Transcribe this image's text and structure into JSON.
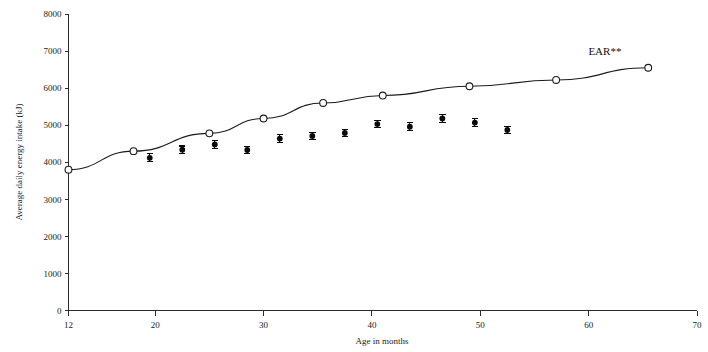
{
  "chart_data": {
    "type": "line",
    "title": "",
    "xlabel": "Age in months",
    "ylabel": "Average daily energy intake (kJ)",
    "xlim": [
      12,
      70
    ],
    "ylim": [
      0,
      8000
    ],
    "grid": false,
    "legend_position": "inline-annotation",
    "x_ticks": [
      12,
      20,
      30,
      40,
      50,
      60,
      70
    ],
    "x_tick_labels": [
      "12",
      "20",
      "30",
      "40",
      "50",
      "60",
      "70"
    ],
    "y_ticks": [
      0,
      1000,
      2000,
      3000,
      4000,
      5000,
      6000,
      7000,
      8000
    ],
    "y_tick_labels": [
      "0",
      "1000",
      "2000",
      "3000",
      "4000",
      "5000",
      "6000",
      "7000",
      "8000"
    ],
    "annotations": [
      {
        "text": "EAR**",
        "x": 61.5,
        "y": 6900
      }
    ],
    "series": [
      {
        "name": "EAR**",
        "marker": "open-circle",
        "line": true,
        "x": [
          12,
          18,
          25,
          30,
          35.5,
          41,
          49,
          57,
          65.5
        ],
        "values": [
          3800,
          4300,
          4780,
          5180,
          5600,
          5800,
          6050,
          6220,
          6550
        ]
      },
      {
        "name": "Average daily energy intake",
        "marker": "filled-circle-with-error-bars",
        "line": false,
        "x": [
          19.5,
          22.5,
          25.5,
          28.5,
          31.5,
          34.5,
          37.5,
          40.5,
          43.5,
          46.5,
          49.5,
          52.5
        ],
        "values": [
          4120,
          4340,
          4480,
          4330,
          4640,
          4710,
          4790,
          5030,
          4960,
          5180,
          5070,
          4870
        ],
        "errors": [
          110,
          100,
          100,
          100,
          100,
          95,
          100,
          100,
          110,
          100,
          105,
          100
        ]
      }
    ]
  },
  "axes": {
    "x_axis_title": "Age in months",
    "y_axis_title": "Average daily energy intake (kJ)"
  }
}
